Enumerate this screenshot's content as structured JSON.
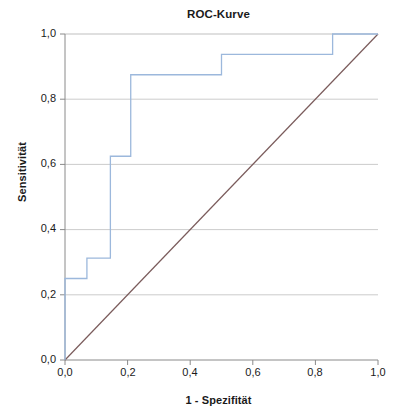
{
  "chart_data": {
    "type": "line",
    "title": "ROC-Kurve",
    "xlabel": "1 - Spezifität",
    "ylabel": "Sensitivität",
    "xlim": [
      0.0,
      1.0
    ],
    "ylim": [
      0.0,
      1.0
    ],
    "grid": true,
    "legend": "none",
    "xticks": [
      0.0,
      0.2,
      0.4,
      0.6,
      0.8,
      1.0
    ],
    "yticks": [
      0.0,
      0.2,
      0.4,
      0.6,
      0.8,
      1.0
    ],
    "xtick_labels": [
      "0,0",
      "0,2",
      "0,4",
      "0,6",
      "0,8",
      "1,0"
    ],
    "ytick_labels": [
      "0,0",
      "0,2",
      "0,4",
      "0,6",
      "0,8",
      "1,0"
    ],
    "series": [
      {
        "name": "ROC-Kurve",
        "color": "#9cb8dc",
        "style": "step",
        "x": [
          0.0,
          0.0,
          0.07,
          0.07,
          0.145,
          0.145,
          0.21,
          0.21,
          0.5,
          0.5,
          0.855,
          0.855,
          1.0
        ],
        "y": [
          0.0,
          0.25,
          0.25,
          0.3125,
          0.3125,
          0.625,
          0.625,
          0.875,
          0.875,
          0.9375,
          0.9375,
          1.0,
          1.0
        ]
      },
      {
        "name": "Bezugslinie",
        "color": "#7a5b5b",
        "style": "diagonal",
        "x": [
          0.0,
          1.0
        ],
        "y": [
          0.0,
          1.0
        ]
      }
    ]
  },
  "chart": {
    "title": "ROC-Kurve",
    "x_axis_title": "1 - Spezifität",
    "y_axis_title": "Sensitivität",
    "y_tick_labels": [
      "1,0",
      "0,8",
      "0,6",
      "0,4",
      "0,2",
      "0,0"
    ],
    "x_tick_labels": [
      "0,0",
      "0,2",
      "0,4",
      "0,6",
      "0,8",
      "1,0"
    ],
    "colors": {
      "curve": "#9cb8dc",
      "reference": "#7a5b5b",
      "grid": "#bfbfbf",
      "axis": "#8a8a8a",
      "text": "#1a1a1a",
      "background": "#ffffff"
    }
  }
}
